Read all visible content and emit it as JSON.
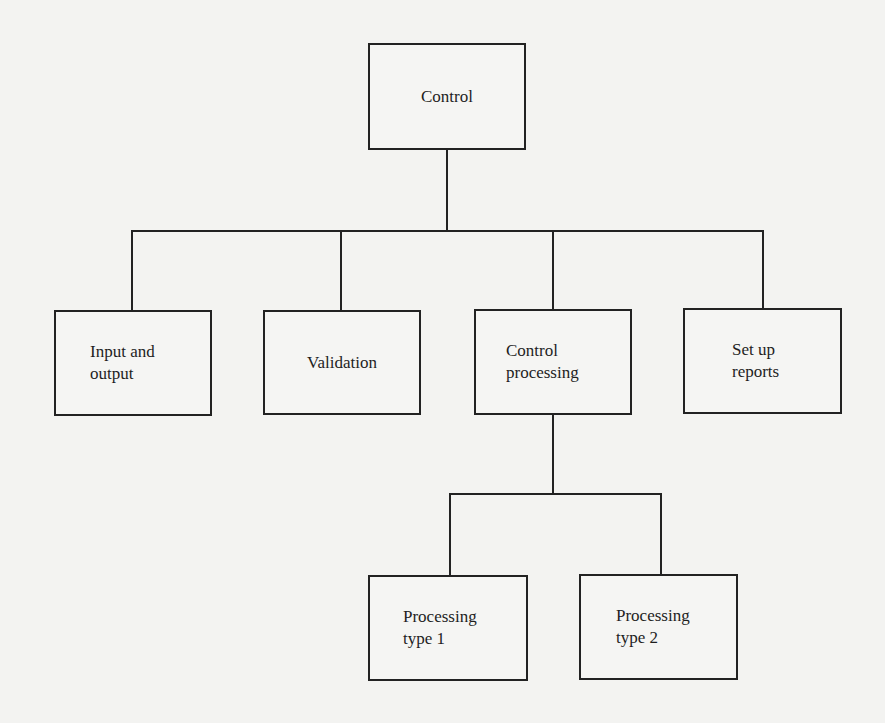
{
  "diagram": {
    "type": "hierarchy",
    "root": {
      "label": "Control"
    },
    "level1": [
      {
        "label": "Input and\noutput"
      },
      {
        "label": "Validation"
      },
      {
        "label": "Control\nprocessing"
      },
      {
        "label": "Set up\nreports"
      }
    ],
    "level2": [
      {
        "label": "Processing\ntype 1",
        "parent": "Control\nprocessing"
      },
      {
        "label": "Processing\ntype 2",
        "parent": "Control\nprocessing"
      }
    ],
    "colors": {
      "background": "#f3f3f1",
      "stroke": "#222222",
      "text": "#1e1e1e"
    }
  }
}
